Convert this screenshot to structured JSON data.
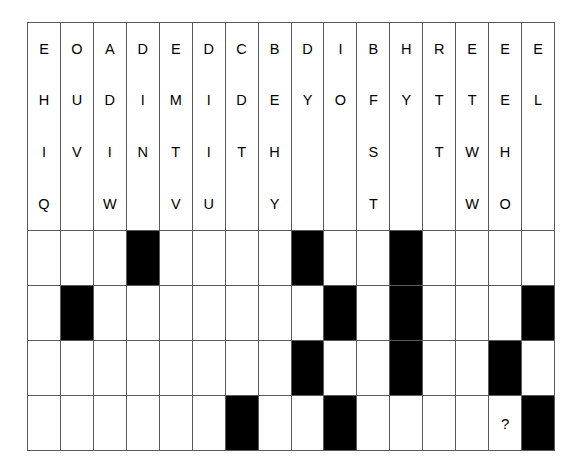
{
  "figure": {
    "type": "letter-grid-pattern-puzzle",
    "columns": 16,
    "letter_rows": 4,
    "pattern_rows": 4,
    "colors": {
      "filled": "#000000",
      "empty": "#ffffff",
      "grid_line": "#5a5a5a",
      "text": "#000000"
    }
  },
  "letters": {
    "columns": [
      [
        "E",
        "H",
        "I",
        "Q"
      ],
      [
        "O",
        "U",
        "V",
        ""
      ],
      [
        "A",
        "D",
        "I",
        "W"
      ],
      [
        "D",
        "I",
        "N",
        ""
      ],
      [
        "E",
        "M",
        "T",
        "V"
      ],
      [
        "D",
        "I",
        "I",
        "U"
      ],
      [
        "C",
        "D",
        "T",
        ""
      ],
      [
        "B",
        "E",
        "H",
        "Y"
      ],
      [
        "D",
        "Y",
        "",
        ""
      ],
      [
        "I",
        "O",
        "",
        ""
      ],
      [
        "B",
        "F",
        "S",
        "T"
      ],
      [
        "H",
        "Y",
        "",
        ""
      ],
      [
        "R",
        "T",
        "T",
        ""
      ],
      [
        "E",
        "T",
        "W",
        "W"
      ],
      [
        "E",
        "E",
        "H",
        "O"
      ],
      [
        "E",
        "L",
        "",
        ""
      ],
      [
        "D",
        "V",
        "",
        ""
      ]
    ],
    "rows": [
      [
        "E",
        "O",
        "A",
        "D",
        "E",
        "D",
        "C",
        "B",
        "D",
        "I",
        "B",
        "H",
        "R",
        "E",
        "E",
        "E",
        "D"
      ],
      [
        "H",
        "U",
        "D",
        "I",
        "M",
        "I",
        "D",
        "E",
        "Y",
        "O",
        "F",
        "Y",
        "T",
        "T",
        "E",
        "L",
        "V"
      ],
      [
        "I",
        "V",
        "I",
        "N",
        "T",
        "I",
        "T",
        "H",
        "",
        "",
        "S",
        "",
        "T",
        "W",
        "H",
        "",
        ""
      ],
      [
        "Q",
        "",
        "W",
        "",
        "V",
        "U",
        "",
        "Y",
        "",
        "",
        "T",
        "",
        "",
        "W",
        "O",
        "",
        ""
      ]
    ]
  },
  "pattern": {
    "rows": [
      [
        0,
        0,
        0,
        1,
        0,
        0,
        0,
        0,
        1,
        0,
        0,
        1,
        0,
        0,
        0,
        0
      ],
      [
        0,
        1,
        0,
        0,
        0,
        0,
        0,
        0,
        0,
        1,
        0,
        1,
        0,
        0,
        0,
        1
      ],
      [
        0,
        0,
        0,
        0,
        0,
        0,
        0,
        0,
        1,
        0,
        0,
        1,
        0,
        0,
        1,
        0
      ],
      [
        0,
        0,
        0,
        0,
        0,
        0,
        1,
        0,
        0,
        1,
        0,
        0,
        0,
        0,
        0,
        1
      ]
    ],
    "question_cell": {
      "row": 3,
      "col": 14,
      "label": "?"
    }
  }
}
